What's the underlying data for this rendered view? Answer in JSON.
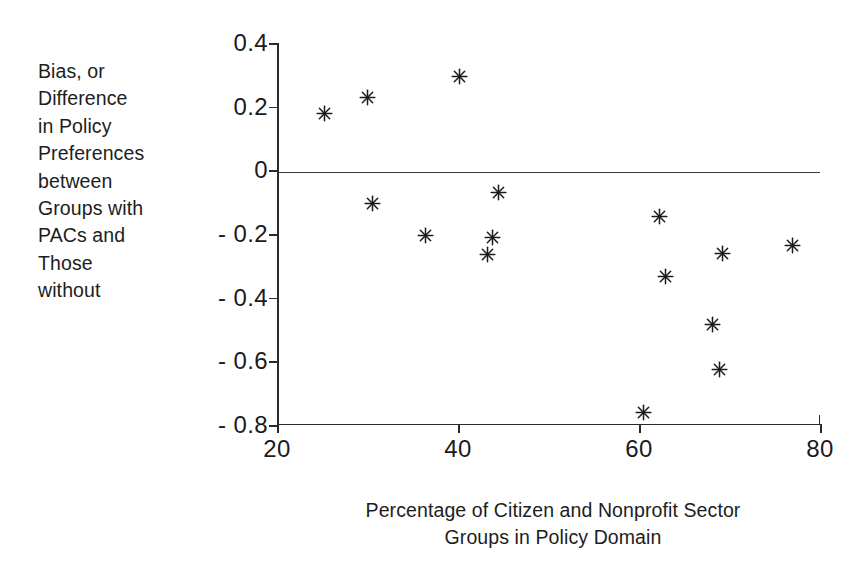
{
  "chart_data": {
    "type": "scatter",
    "title": "",
    "xlabel": "Percentage of Citizen and Nonprofit Sector\nGroups in Policy Domain",
    "ylabel": "Bias, or\nDifference\nin Policy\nPreferences\nbetween\nGroups with\nPACs and\nThose\nwithout",
    "xlim": [
      20,
      80
    ],
    "ylim": [
      -0.8,
      0.4
    ],
    "xticks": [
      20,
      40,
      60,
      80
    ],
    "yticks": [
      0.4,
      0.2,
      0,
      -0.2,
      -0.4,
      -0.6,
      -0.8
    ],
    "xticklabels": [
      "20",
      "40",
      "60",
      "80"
    ],
    "yticklabels": [
      "0.4",
      "0.2",
      "0",
      "- 0.2",
      "- 0.4",
      "- 0.6",
      "- 0.8"
    ],
    "grid": false,
    "legend": null,
    "marker": "asterisk",
    "marker_color": "#1b1b1b",
    "reference_lines": [
      {
        "axis": "y",
        "value": 0,
        "label": "zero-line"
      }
    ],
    "points": [
      {
        "x": 25.3,
        "y": 0.18
      },
      {
        "x": 30.0,
        "y": 0.23
      },
      {
        "x": 40.2,
        "y": 0.295
      },
      {
        "x": 30.6,
        "y": -0.105
      },
      {
        "x": 36.4,
        "y": -0.205
      },
      {
        "x": 44.5,
        "y": -0.07
      },
      {
        "x": 43.8,
        "y": -0.21
      },
      {
        "x": 43.3,
        "y": -0.265
      },
      {
        "x": 62.3,
        "y": -0.145
      },
      {
        "x": 62.9,
        "y": -0.335
      },
      {
        "x": 69.2,
        "y": -0.26
      },
      {
        "x": 68.1,
        "y": -0.485
      },
      {
        "x": 68.9,
        "y": -0.625
      },
      {
        "x": 60.5,
        "y": -0.76
      },
      {
        "x": 77.0,
        "y": -0.235
      }
    ]
  },
  "colors": {
    "background": "#ffffff",
    "axis": "#2a2a2a",
    "text": "#1b1b1b",
    "marker": "#1b1b1b"
  }
}
